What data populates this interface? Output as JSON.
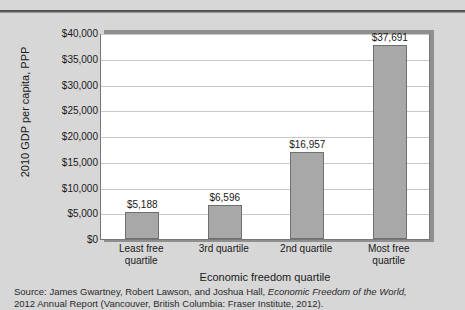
{
  "chart_data": {
    "type": "bar",
    "title": "",
    "subtitle": "",
    "xlabel": "Economic freedom quartile",
    "ylabel": "2010 GDP per capita, PPP",
    "categories": [
      "Least free quartile",
      "3rd quartile",
      "2nd quartile",
      "Most free quartile"
    ],
    "category_lines": [
      [
        "Least free",
        "quartile"
      ],
      [
        "3rd quartile",
        ""
      ],
      [
        "2nd quartile",
        ""
      ],
      [
        "Most free",
        "quartile"
      ]
    ],
    "values": [
      5188,
      6596,
      16957,
      37691
    ],
    "value_labels": [
      "$5,188",
      "$6,596",
      "$16,957",
      "$37,691"
    ],
    "ylim": [
      0,
      40000
    ],
    "ytick_step": 5000,
    "ytick_labels": [
      "$40,000",
      "$35,000",
      "$30,000",
      "$25,000",
      "$20,000",
      "$15,000",
      "$10,000",
      "$5,000",
      "$0"
    ],
    "ytick_values": [
      40000,
      35000,
      30000,
      25000,
      20000,
      15000,
      10000,
      5000,
      0
    ],
    "grid": true,
    "legend": "none",
    "bar_color": "#a8a8a8",
    "bar_border_color": "#6f6f6f",
    "plot_background": "#ffffff",
    "page_background": "#d7d7d7",
    "frame_color": "#8f8f8f"
  },
  "source": {
    "line1_prefix": "Source: James Gwartney, Robert Lawson, and Joshua Hall, ",
    "line1_italic": "Economic Freedom of the World,",
    "line2": "2012 Annual Report (Vancouver, British Columbia: Fraser Institute, 2012)."
  }
}
